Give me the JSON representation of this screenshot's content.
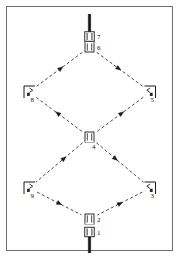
{
  "figure": {
    "title": "",
    "type": "truss-load-path-diagram",
    "frame": {
      "border_color": "#6e6e6e",
      "background": "#ffffff",
      "x": 6,
      "y": 6,
      "width": 166,
      "height": 244
    },
    "line_color": "#1a1a1a",
    "dash_pattern": "3,2.4",
    "nodes": [
      {
        "id": "1",
        "label": "1",
        "x": 89.5,
        "y": 232.0,
        "label_x": 97.0,
        "label_y": 234.5,
        "kind": "fixed-support-double",
        "orientation": "down"
      },
      {
        "id": "2",
        "label": "2",
        "x": 89.5,
        "y": 219.0,
        "label_x": 97.0,
        "label_y": 221.5,
        "kind": "pin-support",
        "orientation": "down"
      },
      {
        "id": "3",
        "label": "3",
        "x": 150.5,
        "y": 188.0,
        "label_x": 150.5,
        "label_y": 197.5,
        "kind": "corner-bracket",
        "orientation": "right"
      },
      {
        "id": "4",
        "label": "4",
        "x": 89.5,
        "y": 137.0,
        "label_x": 92.0,
        "label_y": 148.5,
        "kind": "pin-support",
        "orientation": "center"
      },
      {
        "id": "5",
        "label": "5",
        "x": 150.5,
        "y": 92.0,
        "label_x": 150.5,
        "label_y": 101.5,
        "kind": "corner-bracket",
        "orientation": "right"
      },
      {
        "id": "6",
        "label": "6",
        "x": 89.5,
        "y": 47.0,
        "label_x": 97.0,
        "label_y": 49.5,
        "kind": "pin-support",
        "orientation": "up"
      },
      {
        "id": "7",
        "label": "7",
        "x": 89.5,
        "y": 36.5,
        "label_x": 97.0,
        "label_y": 39.0,
        "kind": "fixed-support-double",
        "orientation": "up"
      },
      {
        "id": "8",
        "label": "8",
        "x": 29.0,
        "y": 92.0,
        "label_x": 30.5,
        "label_y": 101.5,
        "kind": "corner-bracket",
        "orientation": "left"
      },
      {
        "id": "9",
        "label": "9",
        "x": 29.0,
        "y": 188.0,
        "label_x": 30.5,
        "label_y": 197.5,
        "kind": "corner-bracket",
        "orientation": "left"
      }
    ],
    "members": [
      {
        "from": "6",
        "to": "8",
        "arrow_at": 0.47,
        "arrow_dir": "toward-from"
      },
      {
        "from": "6",
        "to": "5",
        "arrow_at": 0.47,
        "arrow_dir": "toward-to"
      },
      {
        "from": "8",
        "to": "4",
        "arrow_at": 0.47,
        "arrow_dir": "toward-from"
      },
      {
        "from": "5",
        "to": "4",
        "arrow_at": 0.47,
        "arrow_dir": "toward-from"
      },
      {
        "from": "4",
        "to": "9",
        "arrow_at": 0.4,
        "arrow_dir": "toward-from"
      },
      {
        "from": "4",
        "to": "3",
        "arrow_at": 0.4,
        "arrow_dir": "toward-to"
      },
      {
        "from": "9",
        "to": "2",
        "arrow_at": 0.5,
        "arrow_dir": "toward-to"
      },
      {
        "from": "3",
        "to": "2",
        "arrow_at": 0.5,
        "arrow_dir": "toward-from"
      }
    ],
    "stems": [
      {
        "name": "top-stem",
        "x": 89.5,
        "y1": 14.0,
        "y2": 33.0
      },
      {
        "name": "bottom-stem",
        "x": 89.5,
        "y1": 236.0,
        "y2": 253.0
      }
    ]
  }
}
